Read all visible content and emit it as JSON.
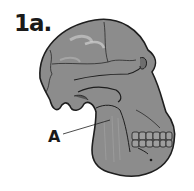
{
  "figure": {
    "label": "1a.",
    "annotations": [
      {
        "id": "A",
        "label": "A",
        "target": "mandible ramus"
      }
    ]
  },
  "colors": {
    "bone_fill": "#8c8c8c",
    "bone_highlight": "#b5b5b5",
    "outline": "#1e1e1e",
    "background": "#ffffff"
  }
}
